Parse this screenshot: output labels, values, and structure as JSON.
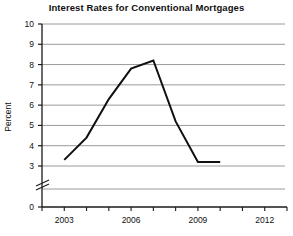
{
  "chart_data": {
    "type": "line",
    "title": "Interest Rates for Conventional Mortgages",
    "xlabel": "",
    "ylabel": "Percent",
    "x": [
      2003,
      2004,
      2005,
      2006,
      2007,
      2008,
      2009,
      2010
    ],
    "values": [
      3.3,
      4.4,
      6.3,
      7.8,
      8.2,
      5.2,
      3.2,
      3.2
    ],
    "series": [
      {
        "name": "Interest rate",
        "values": [
          3.3,
          4.4,
          6.3,
          7.8,
          8.2,
          5.2,
          3.2,
          3.2
        ]
      }
    ],
    "ylim": [
      3,
      10
    ],
    "y_ticks": [
      3,
      4,
      5,
      6,
      7,
      8,
      9,
      10
    ],
    "y_axis_origin_label": "0",
    "y_axis_broken": true,
    "xlim": [
      2002,
      2013
    ],
    "x_ticks": [
      2002,
      2003,
      2004,
      2005,
      2006,
      2007,
      2008,
      2009,
      2010,
      2011,
      2012,
      2013
    ],
    "x_tick_labels": [
      "",
      "2003",
      "",
      "",
      "2006",
      "",
      "",
      "2009",
      "",
      "",
      "2012",
      ""
    ],
    "grid": "horizontal",
    "legend": "none",
    "line_color": "#101010",
    "grid_color": "#9a9a9a",
    "axis_color": "#1a1a1a"
  },
  "labels": {
    "y": [
      "10",
      "9",
      "8",
      "7",
      "6",
      "5",
      "4",
      "3",
      "0"
    ],
    "x": [
      "2003",
      "2006",
      "2009",
      "2012"
    ]
  }
}
